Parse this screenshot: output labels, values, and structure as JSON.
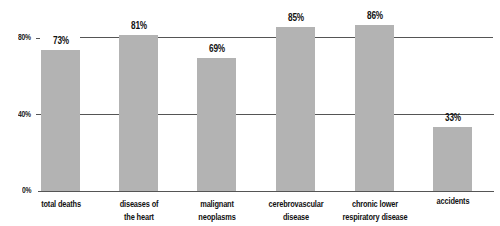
{
  "chart_data": {
    "type": "bar",
    "title": "",
    "xlabel": "",
    "ylabel": "",
    "ylim": [
      0,
      100
    ],
    "yticks": [
      "0%",
      "40%",
      "80%"
    ],
    "grid": true,
    "categories": [
      "total deaths",
      "diseases of the heart",
      "malignant neoplasms",
      "cerebrovascular disease",
      "chronic lower respiratory disease",
      "accidents"
    ],
    "category_lines": [
      [
        "total deaths"
      ],
      [
        "diseases of",
        "the heart"
      ],
      [
        "malignant",
        "neoplasms"
      ],
      [
        "cerebrovascular",
        "disease"
      ],
      [
        "chronic lower",
        "respiratory disease"
      ],
      [
        "accidents"
      ]
    ],
    "values": [
      73,
      81,
      69,
      85,
      86,
      33
    ],
    "value_labels": [
      "73%",
      "81%",
      "69%",
      "85%",
      "86%",
      "33%"
    ],
    "bar_color": "#b3b3b3",
    "grid_color": "#555555"
  }
}
